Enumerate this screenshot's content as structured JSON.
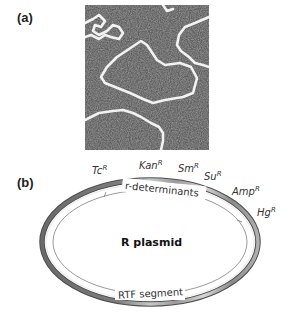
{
  "panels": {
    "a": {
      "label": "(a)",
      "description": "Electron micrograph of circular plasmid DNA molecules"
    },
    "b": {
      "label": "(b)",
      "title": "R plasmid",
      "region_labels": {
        "upper": "r-determinants",
        "lower": "RTF segment"
      },
      "resistance_genes": [
        {
          "name": "Tc",
          "sup": "R"
        },
        {
          "name": "Kan",
          "sup": "R"
        },
        {
          "name": "Sm",
          "sup": "R"
        },
        {
          "name": "Su",
          "sup": "R"
        },
        {
          "name": "Amp",
          "sup": "R"
        },
        {
          "name": "Hg",
          "sup": "R"
        }
      ]
    }
  },
  "colors": {
    "ring_dark": "#5a5a5a",
    "ring_light": "#d8d8d8",
    "micrograph_bg": "#5e5e5e",
    "dna_strand": "#f2f2f2"
  }
}
